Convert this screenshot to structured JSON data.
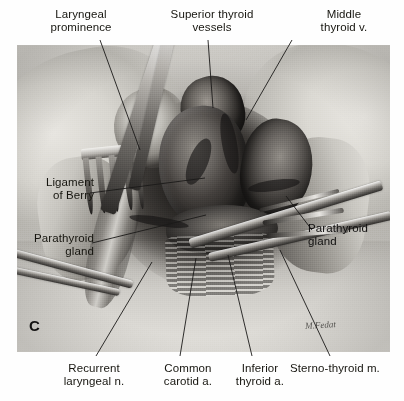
{
  "figure": {
    "letter": "C",
    "signature": "artist-signature",
    "kind": "anatomical surgical illustration"
  },
  "labels": {
    "laryngeal_prominence": "Laryngeal\nprominence",
    "superior_thyroid_vessels": "Superior thyroid\nvessels",
    "middle_thyroid_vein": "Middle\nthyroid v.",
    "ligament_of_berry": "Ligament\nof Berry",
    "parathyroid_gland_left": "Parathyroid\ngland",
    "parathyroid_gland_right": "Parathyroid\ngland",
    "recurrent_laryngeal_nerve": "Recurrent\nlaryngeal n.",
    "common_carotid_artery": "Common\ncarotid a.",
    "inferior_thyroid_artery": "Inferior\nthyroid a.",
    "sternothyroid_muscle": "Sterno-thyroid m."
  },
  "colors": {
    "page_background": "#ffffff",
    "plate_background": "#b9b7b2",
    "text": "#16150f",
    "leader_line": "#1b1a19"
  }
}
